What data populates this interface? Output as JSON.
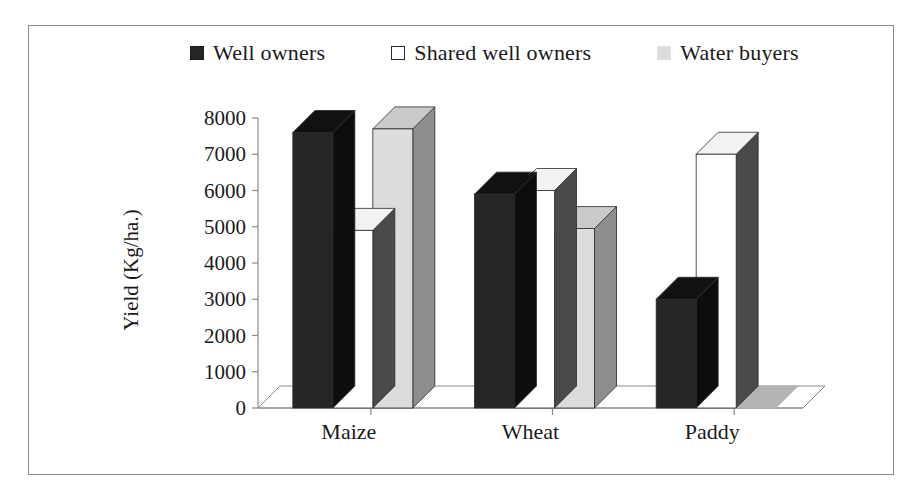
{
  "chart_data": {
    "type": "bar",
    "title": "",
    "subtitle": "",
    "xlabel": "",
    "ylabel": "Yield (Kg/ha.)",
    "categories": [
      "Maize",
      "Wheat",
      "Paddy"
    ],
    "series": [
      {
        "name": "Well owners",
        "values": [
          7600,
          5900,
          3000
        ],
        "color": "#262626",
        "swatch": "swatch-dark"
      },
      {
        "name": "Shared well owners",
        "values": [
          4900,
          6000,
          7000
        ],
        "color": "#ffffff",
        "swatch": "swatch-white"
      },
      {
        "name": "Water buyers",
        "values": [
          7700,
          4950,
          0
        ],
        "color": "#dcdcdc",
        "swatch": "swatch-gray"
      }
    ],
    "ylim": [
      0,
      8000
    ],
    "yticks": [
      0,
      1000,
      2000,
      3000,
      4000,
      5000,
      6000,
      7000,
      8000
    ],
    "ytick_labels": [
      "0",
      "1000",
      "2000",
      "3000",
      "4000",
      "5000",
      "6000",
      "7000",
      "8000"
    ],
    "grid": false,
    "legend_position": "top",
    "style": "3d-column"
  },
  "legend": {
    "entries": [
      {
        "label": "Well owners"
      },
      {
        "label": "Shared well owners"
      },
      {
        "label": "Water buyers"
      }
    ]
  },
  "axis": {
    "ylabel": "Yield (Kg/ha.)",
    "ytick_labels": [
      "8000",
      "7000",
      "6000",
      "5000",
      "4000",
      "3000",
      "2000",
      "1000",
      "0"
    ],
    "category_labels": [
      "Maize",
      "Wheat",
      "Paddy"
    ]
  },
  "colors": {
    "series_dark": "#262626",
    "series_white": "#ffffff",
    "series_gray": "#dcdcdc",
    "frame": "#8d8d8d",
    "axis": "#8a8a8a",
    "text": "#1a1a1a"
  }
}
